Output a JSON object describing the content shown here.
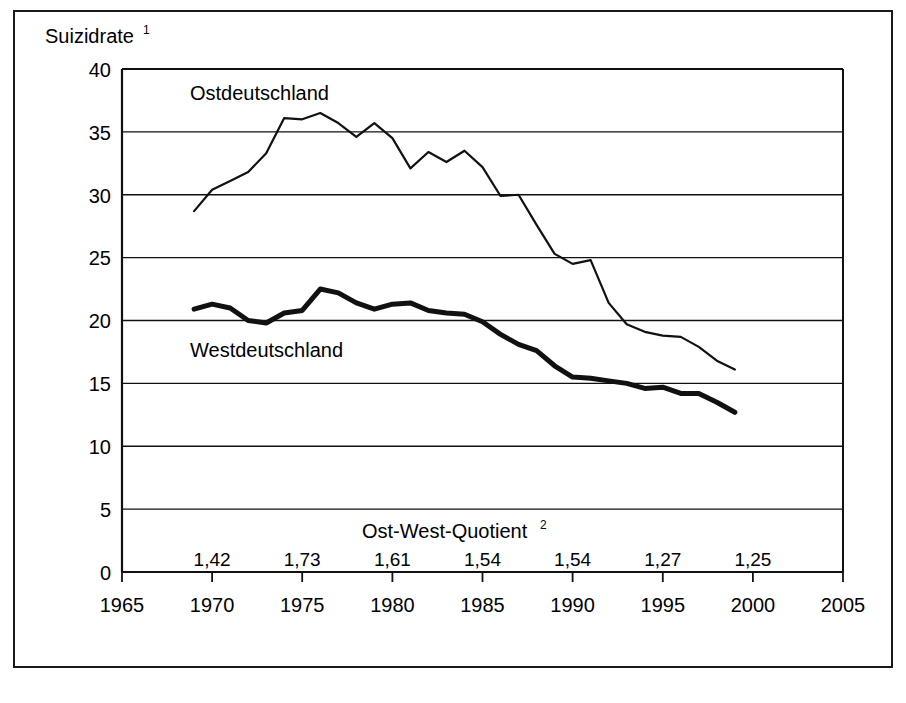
{
  "figure": {
    "y_axis_title": "Suizidrate",
    "y_axis_title_superscript": "1",
    "quotient_label": "Ost-West-Quotient",
    "quotient_label_superscript": "2",
    "series_label_east": "Ostdeutschland",
    "series_label_west": "Westdeutschland"
  },
  "chart_data": {
    "type": "line",
    "title": "",
    "xlabel": "",
    "ylabel": "Suizidrate",
    "xlim": [
      1965,
      2005
    ],
    "ylim": [
      0,
      40
    ],
    "grid": true,
    "legend": "inline-labels",
    "y_ticks": [
      0,
      5,
      10,
      15,
      20,
      25,
      30,
      35,
      40
    ],
    "x_ticks": [
      1965,
      1970,
      1975,
      1980,
      1985,
      1990,
      1995,
      2000,
      2005
    ],
    "y_tick_labels": [
      "0",
      "5",
      "10",
      "15",
      "20",
      "25",
      "30",
      "35",
      "40"
    ],
    "x_tick_labels": [
      "1965",
      "1970",
      "1975",
      "1980",
      "1985",
      "1990",
      "1995",
      "2000",
      "2005"
    ],
    "x": [
      1969,
      1970,
      1971,
      1972,
      1973,
      1974,
      1975,
      1976,
      1977,
      1978,
      1979,
      1980,
      1981,
      1982,
      1983,
      1984,
      1985,
      1986,
      1987,
      1988,
      1989,
      1990,
      1991,
      1992,
      1993,
      1994,
      1995,
      1996,
      1997,
      1998,
      1999
    ],
    "series": [
      {
        "name": "Ostdeutschland",
        "values": [
          28.7,
          30.4,
          31.1,
          31.8,
          33.3,
          36.1,
          36.0,
          36.5,
          35.7,
          34.6,
          35.7,
          34.5,
          32.1,
          33.4,
          32.6,
          33.5,
          32.2,
          29.9,
          30.0,
          27.6,
          25.3,
          24.5,
          24.8,
          21.4,
          19.7,
          19.1,
          18.8,
          18.7,
          17.9,
          16.8,
          16.1
        ]
      },
      {
        "name": "Westdeutschland",
        "values": [
          20.9,
          21.3,
          21.0,
          20.0,
          19.8,
          20.6,
          20.8,
          22.5,
          22.2,
          21.4,
          20.9,
          21.3,
          21.4,
          20.8,
          20.6,
          20.5,
          19.9,
          18.9,
          18.1,
          17.6,
          16.4,
          15.5,
          15.4,
          15.2,
          15.0,
          14.6,
          14.7,
          14.2,
          14.2,
          13.5,
          12.7
        ]
      }
    ],
    "quotient_row": {
      "label": "Ost-West-Quotient",
      "years": [
        1970,
        1975,
        1980,
        1985,
        1990,
        1995,
        2000
      ],
      "values": [
        "1,42",
        "1,73",
        "1,61",
        "1,54",
        "1,54",
        "1,27",
        "1,25"
      ]
    }
  },
  "colors": {
    "ink": "#111111",
    "background": "#ffffff"
  }
}
